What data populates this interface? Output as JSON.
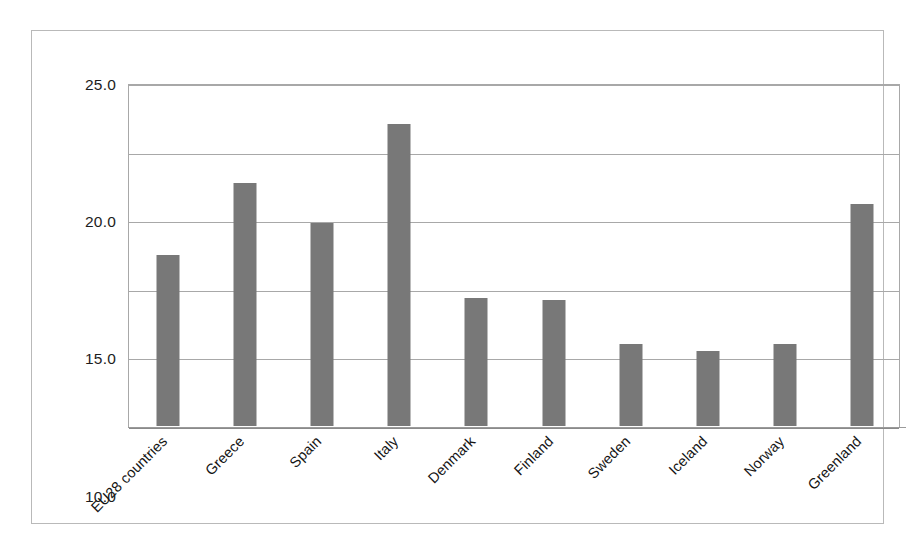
{
  "chart_data": {
    "type": "bar",
    "title": "",
    "subtitle": "",
    "xlabel": "",
    "ylabel": "",
    "categories": [
      "EU28 countries",
      "Greece",
      "Spain",
      "Italy",
      "Denmark",
      "Finland",
      "Sweden",
      "Iceland",
      "Norway",
      "Greenland"
    ],
    "values": [
      12.5,
      17.7,
      14.8,
      22.0,
      9.3,
      9.2,
      6.0,
      5.5,
      6.0,
      16.2
    ],
    "series": [
      {
        "name": "",
        "values": [
          12.5,
          17.7,
          14.8,
          22.0,
          9.3,
          9.2,
          6.0,
          5.5,
          6.0,
          16.2
        ]
      }
    ],
    "ylim": [
      0.0,
      25.0
    ],
    "ytick_labels": [
      "0.0",
      "5.0",
      "10.0",
      "15.0",
      "20.0",
      "25.0"
    ],
    "ytick_values": [
      0.0,
      5.0,
      10.0,
      15.0,
      20.0,
      25.0
    ],
    "grid": "horizontal",
    "legend": "none",
    "bar_color": "#787878",
    "gridline_color": "#a8a8a8",
    "frame_color": "#b9b9b9",
    "background_color": "#ffffff",
    "xlabel_rotation": -45
  }
}
